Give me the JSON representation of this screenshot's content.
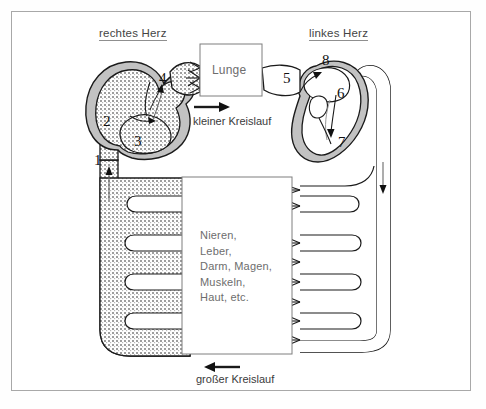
{
  "diagram": {
    "title_right_heart": "rechtes Herz",
    "title_left_heart": "linkes Herz",
    "lung_label": "Lunge",
    "organ_lines": [
      "Nieren,",
      "Leber,",
      "Darm, Magen,",
      "Muskeln,",
      "Haut, etc."
    ],
    "organ_text": "Nieren,\nLeber,\nDarm, Magen,\nMuskeln,\nHaut, etc.",
    "pulmonary_circuit_label": "kleiner Kreislauf",
    "systemic_circuit_label": "großer Kreislauf",
    "numbers": {
      "n1": "1",
      "n2": "2",
      "n3": "3",
      "n4": "4",
      "n5": "5",
      "n6": "6",
      "n7": "7",
      "n8": "8"
    },
    "colors": {
      "frame_border": "#a8a8a8",
      "background": "#ffffff",
      "muscle_gray": "#c2c2c2",
      "deoxygenated_fill": "#d8d8d8",
      "oxygenated_fill": "#ffffff",
      "outline": "#1a1a1a",
      "text": "#3b3b3b",
      "organ_text": "#6d6d6d"
    }
  }
}
